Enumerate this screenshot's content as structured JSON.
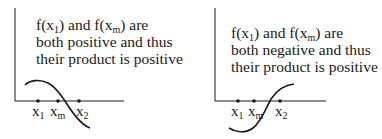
{
  "panels": [
    {
      "id": "left",
      "caption": {
        "line1_prefix": "f(x",
        "line1_sub1": "1",
        "line1_mid": ") and  f(x",
        "line1_sub2": "m",
        "line1_suffix": ") are",
        "line2": "both positive and thus",
        "line3": "their product is positive"
      },
      "labels": {
        "x1": {
          "base": "x",
          "sub": "1"
        },
        "xm": {
          "base": "x",
          "sub": "m"
        },
        "x2": {
          "base": "x",
          "sub": "2"
        }
      },
      "case": "f(x1) > 0 and f(xm) > 0"
    },
    {
      "id": "right",
      "caption": {
        "line1_prefix": "f(x",
        "line1_sub1": "1",
        "line1_mid": ") and  f(x",
        "line1_sub2": "m",
        "line1_suffix": ") are",
        "line2": "both negative and thus",
        "line3": "their product is positive"
      },
      "labels": {
        "x1": {
          "base": "x",
          "sub": "1"
        },
        "xm": {
          "base": "x",
          "sub": "m"
        },
        "x2": {
          "base": "x",
          "sub": "2"
        }
      },
      "case": "f(x1) < 0 and f(xm) < 0"
    }
  ],
  "colors": {
    "ink": "#1a1a1a",
    "background": "#ffffff"
  }
}
